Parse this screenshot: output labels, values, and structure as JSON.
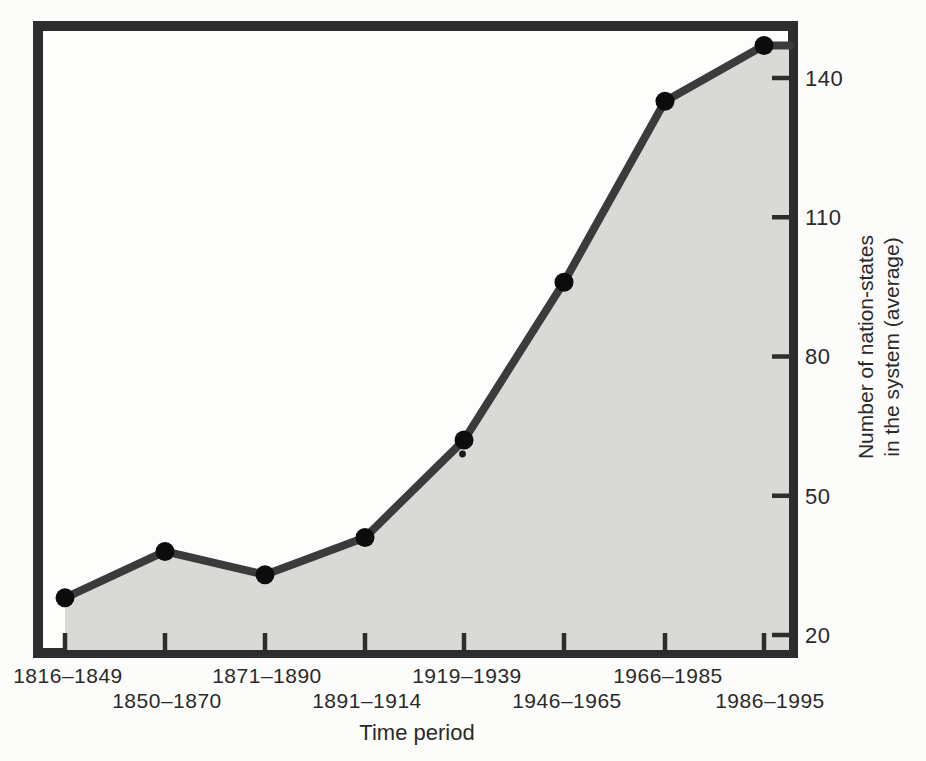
{
  "chart_data": {
    "type": "area",
    "title": "",
    "xlabel": "Time period",
    "ylabel": "Number of nation-states in the system (average)",
    "ylabel_lines": [
      "Number of nation-states",
      "in the system (average)"
    ],
    "categories": [
      "1816–1849",
      "1850–1870",
      "1871–1890",
      "1891–1914",
      "1919–1939",
      "1946–1965",
      "1966–1985",
      "1986–1995"
    ],
    "values": [
      28,
      38,
      33,
      41,
      62,
      96,
      135,
      147
    ],
    "yticks": [
      20,
      50,
      80,
      110,
      140
    ],
    "ylim": [
      17,
      149
    ],
    "grid": false,
    "legend": "none",
    "colors": {
      "line": "#3b3b3b",
      "point": "#0c0c0c",
      "fill": "#d9d9d6",
      "frame": "#2d2d2d",
      "text": "#2a2a2a",
      "background": "#fcfcfb"
    }
  }
}
